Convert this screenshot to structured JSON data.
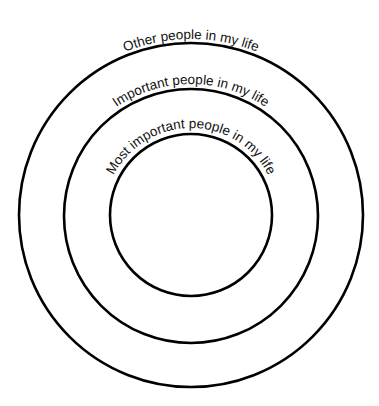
{
  "diagram": {
    "type": "concentric-circles",
    "rings": [
      {
        "id": "outer",
        "label": "Other people in my life"
      },
      {
        "id": "middle",
        "label": "Important people in my life"
      },
      {
        "id": "inner",
        "label": "Most important people in my life"
      }
    ]
  }
}
